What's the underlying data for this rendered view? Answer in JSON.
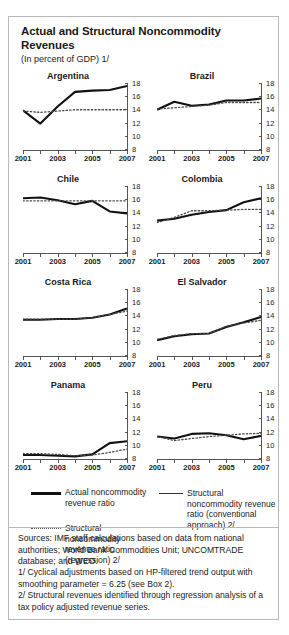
{
  "figure": {
    "title": "Actual and Structural Noncommodity Revenues",
    "subtitle": "(In percent of GDP) 1/"
  },
  "legend": {
    "actual": "Actual noncommodity revenue ratio",
    "regression": "Structural noncommodity revenue ratio (regression) 2/",
    "conventional": "Structural noncommodity revenue ratio (conventional approach) 2/"
  },
  "notes": [
    "Sources:  IMF staff calculations based on data from national authorities; World Bank Commodities Unit; UNCOMTRADE database; and WEO.",
    "1/ Cyclical adjustments based on HP-filtered trend output with smoothing parameter = 6.25 (see Box 2).",
    "2/ Structural revenues identified through regression analysis of a tax policy adjusted revenue series."
  ],
  "chart_data": {
    "type": "line",
    "title": "Actual and Structural Noncommodity Revenues",
    "subtitle": "(In percent of GDP) 1/",
    "xlabel": "",
    "ylabel": "Percent of GDP",
    "x": [
      2001,
      2002,
      2003,
      2004,
      2005,
      2006,
      2007
    ],
    "xticks": [
      "2001",
      "2003",
      "2005",
      "2007"
    ],
    "xlim": [
      2001,
      2007
    ],
    "ylim": [
      8,
      18
    ],
    "yticks": [
      8,
      10,
      12,
      14,
      16,
      18
    ],
    "grid": false,
    "legend_position": "bottom",
    "panels": [
      {
        "name": "Argentina",
        "series": [
          {
            "name": "Actual noncommodity revenue ratio",
            "style": "thick-solid",
            "values": [
              14.0,
              12.0,
              14.6,
              16.8,
              17.0,
              17.1,
              17.7
            ]
          },
          {
            "name": "Structural noncommodity revenue ratio (regression) 2/",
            "style": "dotted",
            "values": [
              13.9,
              13.7,
              13.9,
              14.1,
              14.1,
              14.1,
              14.1
            ]
          }
        ]
      },
      {
        "name": "Brazil",
        "series": [
          {
            "name": "Actual noncommodity revenue ratio",
            "style": "thick-solid",
            "values": [
              14.1,
              15.3,
              14.7,
              14.9,
              15.5,
              15.5,
              15.8
            ]
          },
          {
            "name": "Structural noncommodity revenue ratio (regression) 2/",
            "style": "dotted",
            "values": [
              14.2,
              14.4,
              14.6,
              14.8,
              15.2,
              15.2,
              15.2
            ]
          }
        ]
      },
      {
        "name": "Chile",
        "series": [
          {
            "name": "Actual noncommodity revenue ratio",
            "style": "thick-solid",
            "values": [
              16.3,
              16.4,
              16.0,
              15.4,
              15.9,
              14.3,
              14.0
            ]
          },
          {
            "name": "Structural noncommodity revenue ratio (regression) 2/",
            "style": "dotted",
            "values": [
              15.9,
              15.9,
              15.9,
              15.9,
              15.9,
              15.9,
              15.9
            ]
          }
        ]
      },
      {
        "name": "Colombia",
        "series": [
          {
            "name": "Actual noncommodity revenue ratio",
            "style": "thick-solid",
            "values": [
              12.9,
              13.2,
              13.8,
              14.2,
              14.5,
              15.7,
              16.3
            ]
          },
          {
            "name": "Structural noncommodity revenue ratio (regression) 2/",
            "style": "dotted",
            "values": [
              12.6,
              13.4,
              14.4,
              14.4,
              14.5,
              14.6,
              14.6
            ]
          }
        ]
      },
      {
        "name": "Costa Rica",
        "series": [
          {
            "name": "Actual noncommodity revenue ratio",
            "style": "thick-solid",
            "values": [
              13.5,
              13.5,
              13.6,
              13.6,
              13.8,
              14.3,
              15.2
            ]
          },
          {
            "name": "Structural noncommodity revenue ratio (regression) 2/",
            "style": "dotted",
            "values": [
              13.6,
              13.6,
              13.6,
              13.6,
              13.8,
              14.3,
              14.8
            ]
          }
        ]
      },
      {
        "name": "El Salvador",
        "series": [
          {
            "name": "Actual noncommodity revenue ratio",
            "style": "thick-solid",
            "values": [
              10.4,
              11.0,
              11.3,
              11.4,
              12.4,
              13.1,
              13.9
            ]
          },
          {
            "name": "Structural noncommodity revenue ratio (regression) 2/",
            "style": "dotted",
            "values": [
              10.5,
              11.1,
              11.4,
              11.4,
              12.5,
              13.0,
              13.4
            ]
          }
        ]
      },
      {
        "name": "Panama",
        "series": [
          {
            "name": "Actual noncommodity revenue ratio",
            "style": "thick-solid",
            "values": [
              8.6,
              8.6,
              8.5,
              8.4,
              8.7,
              10.4,
              10.7
            ]
          },
          {
            "name": "Structural noncommodity revenue ratio (regression) 2/",
            "style": "dotted",
            "values": [
              8.8,
              8.8,
              8.7,
              8.5,
              8.6,
              9.0,
              9.5
            ]
          }
        ]
      },
      {
        "name": "Peru",
        "series": [
          {
            "name": "Actual noncommodity revenue ratio",
            "style": "thick-solid",
            "values": [
              11.4,
              11.1,
              11.8,
              11.9,
              11.6,
              11.0,
              11.5
            ]
          },
          {
            "name": "Structural noncommodity revenue ratio (regression) 2/",
            "style": "dotted",
            "values": [
              11.4,
              10.8,
              11.1,
              11.4,
              11.6,
              11.8,
              11.9
            ]
          }
        ]
      }
    ]
  }
}
